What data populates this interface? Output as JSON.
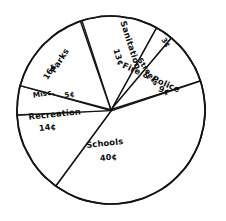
{
  "chart_data": {
    "type": "pie",
    "title": "",
    "subtitle": "",
    "xlabel": "",
    "ylabel": "",
    "legend": "none",
    "grid": false,
    "units": "cents",
    "total": "100",
    "style": "hand-drawn sketch, black ink on white, hatched shading on right rim",
    "categories": [
      "Sanitation",
      "Streets",
      "Fire & Police",
      "Schools",
      "Recreation",
      "Misc.",
      "Parks"
    ],
    "values": [
      13,
      3,
      9,
      40,
      14,
      5,
      16
    ],
    "value_labels": [
      "13¢",
      "3¢",
      "9¢",
      "40¢",
      "14¢",
      "5¢",
      "16¢"
    ],
    "slices": [
      {
        "name": "sanitation",
        "label": "Sanitation",
        "value": 13,
        "value_label": "13¢",
        "start_deg": -108,
        "end_deg": -61,
        "label_x": 128,
        "label_y": 46,
        "label_rot": 72,
        "value_x": 116,
        "value_y": 58,
        "value_rot": 72
      },
      {
        "name": "streets",
        "label": "Streets",
        "value": 3,
        "value_label": "3¢",
        "start_deg": -61,
        "end_deg": -50,
        "label_x": 146,
        "label_y": 73,
        "label_rot": 56,
        "value_x": 164,
        "value_y": 44,
        "value_rot": 56
      },
      {
        "name": "fire-and-police",
        "label": "Fire & Police",
        "value": 9,
        "value_label": "9¢",
        "start_deg": -50,
        "end_deg": -18,
        "label_x": 150,
        "label_y": 80,
        "label_rot": 24,
        "value_x": 163,
        "value_y": 93,
        "value_rot": 24
      },
      {
        "name": "schools",
        "label": "Schools",
        "value": 40,
        "value_label": "40¢",
        "start_deg": -18,
        "end_deg": 126,
        "label_x": 105,
        "label_y": 146,
        "label_rot": -6,
        "value_x": 109,
        "value_y": 160,
        "value_rot": -6
      },
      {
        "name": "recreation",
        "label": "Recreation",
        "value": 14,
        "value_label": "14¢",
        "start_deg": 126,
        "end_deg": 177,
        "label_x": 55,
        "label_y": 117,
        "label_rot": -6,
        "value_x": 48,
        "value_y": 130,
        "value_rot": -6
      },
      {
        "name": "misc",
        "label": "Misc.",
        "value": 5,
        "value_label": "5¢",
        "start_deg": 177,
        "end_deg": 195,
        "label_x": 44,
        "label_y": 96,
        "label_rot": -9,
        "value_x": 70,
        "value_y": 97,
        "value_rot": -9
      },
      {
        "name": "parks",
        "label": "Parks",
        "value": 16,
        "value_label": "16¢",
        "start_deg": 195,
        "end_deg": 251,
        "label_x": 62,
        "label_y": 62,
        "label_rot": -58,
        "value_x": 52,
        "value_y": 73,
        "value_rot": -58
      }
    ],
    "geometry": {
      "center_x": 111,
      "center_y": 110,
      "radius": 94
    },
    "shading": {
      "name": "rim-shadow",
      "start_deg": -58,
      "end_deg": 56,
      "description": "hatched ribbed band along right edge"
    }
  },
  "colors": {
    "ink": "#141414",
    "paper": "#ffffff",
    "shade": "#111111"
  }
}
